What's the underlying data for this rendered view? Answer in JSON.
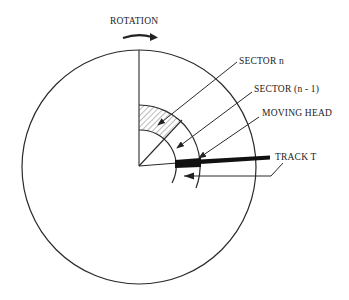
{
  "diagram": {
    "colors": {
      "line": "#2a2a2a",
      "background": "#ffffff",
      "hatch": "#555555",
      "head": "#111111"
    },
    "labels": {
      "rotation": "ROTATION",
      "sector_n": "SECTOR n",
      "sector_n_minus_1": "SECTOR (n - 1)",
      "moving_head": "MOVING HEAD",
      "track_t": "TRACK T"
    },
    "geometry": {
      "disk_center": [
        139,
        166
      ],
      "disk_radius": 117,
      "track_inner_radius": 36,
      "track_outer_radius": 61
    }
  }
}
